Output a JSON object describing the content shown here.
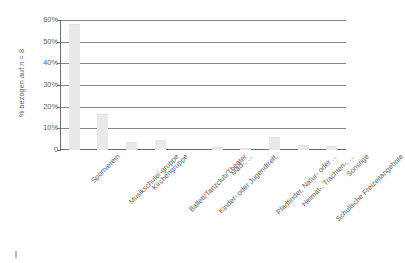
{
  "chart_data": {
    "type": "bar",
    "title": "",
    "xlabel": "",
    "ylabel": "% bezogen auf n = 8",
    "ylim": [
      0,
      60
    ],
    "grid": true,
    "legend": false,
    "ytick_labels": [
      "60%",
      "50%",
      "40%",
      "30%",
      "20%",
      "10%",
      "0"
    ],
    "ytick_values": [
      60,
      50,
      40,
      30,
      20,
      10,
      0
    ],
    "categories": [
      "Sportverein",
      "Musikschule/-gruppe",
      "Kirchengruppe",
      "Ballett/Tanzclub/Theater",
      "Kinder- oder Jugendtreff,",
      "Mäd-, ...",
      "Pfadfinder, Natur- oder ...",
      "Heimat-, Trachten-, ...",
      "Schulische Freizeitangebote",
      "Sonstige"
    ],
    "categories_display": [
      {
        "line1": "Sportverein",
        "line2": ""
      },
      {
        "line1": "Musikschule/-gruppe",
        "line2": ""
      },
      {
        "line1": "Kirchengruppe",
        "line2": ""
      },
      {
        "line1": "Ballett/Tanzclub/Theater",
        "line2": ""
      },
      {
        "line1": "Kinder- oder Jugendtreff,",
        "line2": ""
      },
      {
        "line1": "Mäd-, ...",
        "line2": ""
      },
      {
        "line1": "Pfadfinder, Natur- oder ...",
        "line2": ""
      },
      {
        "line1": "Heimat-, Trachten-, ...",
        "line2": ""
      },
      {
        "line1": "Schulische Freizeitangebote",
        "line2": ""
      },
      {
        "line1": "Sonstige",
        "line2": ""
      }
    ],
    "values": [
      58,
      16.5,
      3.5,
      4.5,
      0,
      1.5,
      1,
      6,
      2.5,
      2
    ],
    "bar_color": "#e9e9e9",
    "gridline_color": "#878787",
    "axis_color": "#6e6e6e",
    "text_color": "#5a5a5a"
  }
}
